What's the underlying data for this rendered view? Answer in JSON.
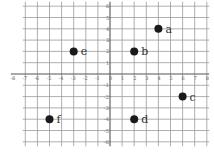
{
  "chart_data": {
    "type": "scatter",
    "title": "",
    "xlabel": "",
    "ylabel": "",
    "xlim": [
      -8,
      8
    ],
    "ylim": [
      -6,
      6
    ],
    "grid": true,
    "x_ticks": [
      -8,
      -7,
      -6,
      -5,
      -4,
      -3,
      -2,
      -1,
      0,
      1,
      2,
      3,
      4,
      5,
      6,
      7,
      8
    ],
    "y_ticks": [
      -6,
      -5,
      -4,
      -3,
      -2,
      -1,
      0,
      1,
      2,
      3,
      4,
      5,
      6
    ],
    "points": [
      {
        "label": "a",
        "x": 4,
        "y": 4
      },
      {
        "label": "b",
        "x": 2,
        "y": 2
      },
      {
        "label": "c",
        "x": 6,
        "y": -2
      },
      {
        "label": "d",
        "x": 2,
        "y": -4
      },
      {
        "label": "e",
        "x": -3,
        "y": 2
      },
      {
        "label": "f",
        "x": -5,
        "y": -4
      }
    ]
  },
  "colors": {
    "grid": "#9a9a9a",
    "axis": "#555555",
    "point": "#1a1a1a",
    "label": "#333333",
    "tick": "#666666"
  }
}
